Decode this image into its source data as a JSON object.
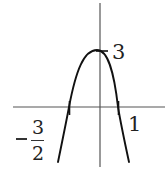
{
  "diagram": {
    "type": "function-graph",
    "labels": {
      "y_intercept": "3",
      "right_root": "1",
      "left_root_sign": "−",
      "left_root_numerator": "3",
      "left_root_denominator": "2"
    },
    "colors": {
      "curve": "#111111",
      "axes": "#555555",
      "background": "#ffffff"
    }
  }
}
